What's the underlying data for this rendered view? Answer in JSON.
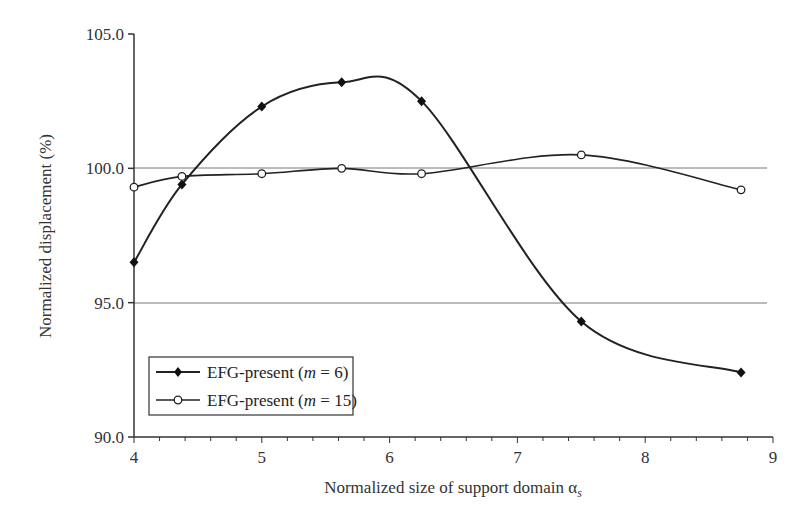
{
  "chart_data": {
    "type": "line",
    "title": "",
    "xlabel": "Normalized size of support domain α",
    "xlabel_subscript": "s",
    "ylabel": "Normalized displacement (%)",
    "xlim": [
      4,
      9
    ],
    "ylim": [
      90.0,
      105.0
    ],
    "xticks": [
      "4",
      "5",
      "6",
      "7",
      "8",
      "9"
    ],
    "yticks": [
      "90.0",
      "95.0",
      "100.0",
      "105.0"
    ],
    "reference_lines": [
      100.0,
      95.0
    ],
    "legend_position": "lower left",
    "x": [
      4.0,
      4.375,
      5.0,
      5.625,
      6.25,
      7.5,
      8.75
    ],
    "series": [
      {
        "name": "EFG-present (m = 6)",
        "marker": "filled-diamond",
        "values": [
          96.5,
          99.4,
          102.3,
          103.2,
          102.5,
          94.3,
          92.4
        ]
      },
      {
        "name": "EFG-present (m = 15)",
        "marker": "open-circle",
        "values": [
          99.3,
          99.7,
          99.8,
          100.0,
          99.8,
          100.5,
          99.2
        ]
      }
    ]
  },
  "legend": {
    "item1": {
      "prefix": "EFG-present (",
      "var": "m",
      "suffix": " = 6)"
    },
    "item2": {
      "prefix": "EFG-present (",
      "var": "m",
      "suffix": " = 15)"
    }
  }
}
